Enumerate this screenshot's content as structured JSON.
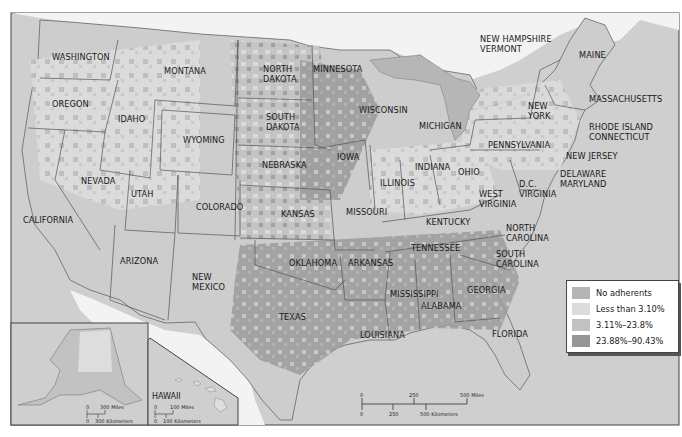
{
  "map": {
    "title": "",
    "subject": "Adherence rates by county, contiguous United States with Alaska and Hawaii insets",
    "colors": {
      "background_water": "#cfcfcf",
      "land_outside": "#f2f2f2",
      "no_adherents": "#b4b4b4",
      "less_than_3_10": "#dcdcdc",
      "3_11_to_23_8": "#bcbcbc",
      "23_88_to_90_43": "#969696",
      "border": "#555555"
    },
    "legend": {
      "items": [
        {
          "label": "No adherents",
          "color": "#b4b4b4"
        },
        {
          "label": "Less than 3.10%",
          "color": "#dcdcdc"
        },
        {
          "label": "3.11%–23.8%",
          "color": "#c2c2c2"
        },
        {
          "label": "23.88%–90.43%",
          "color": "#969696"
        }
      ]
    },
    "state_labels": [
      {
        "name": "WASHINGTON",
        "x": 52,
        "y": 60
      },
      {
        "name": "OREGON",
        "x": 52,
        "y": 107
      },
      {
        "name": "IDAHO",
        "x": 118,
        "y": 122
      },
      {
        "name": "MONTANA",
        "x": 164,
        "y": 74
      },
      {
        "name": "WYOMING",
        "x": 183,
        "y": 143
      },
      {
        "name": "NEVADA",
        "x": 81,
        "y": 184
      },
      {
        "name": "UTAH",
        "x": 131,
        "y": 197
      },
      {
        "name": "COLORADO",
        "x": 196,
        "y": 210
      },
      {
        "name": "CALIFORNIA",
        "x": 23,
        "y": 223
      },
      {
        "name": "ARIZONA",
        "x": 120,
        "y": 264
      },
      {
        "name": "NEW|MEXICO",
        "x": 192,
        "y": 280
      },
      {
        "name": "NORTH|DAKOTA",
        "x": 263,
        "y": 72
      },
      {
        "name": "MINNESOTA",
        "x": 313,
        "y": 72
      },
      {
        "name": "SOUTH|DAKOTA",
        "x": 266,
        "y": 120
      },
      {
        "name": "NEBRASKA",
        "x": 262,
        "y": 168
      },
      {
        "name": "IOWA",
        "x": 337,
        "y": 160
      },
      {
        "name": "KANSAS",
        "x": 281,
        "y": 217
      },
      {
        "name": "OKLAHOMA",
        "x": 289,
        "y": 266
      },
      {
        "name": "TEXAS",
        "x": 279,
        "y": 320
      },
      {
        "name": "WISCONSIN",
        "x": 359,
        "y": 113
      },
      {
        "name": "MICHIGAN",
        "x": 419,
        "y": 129
      },
      {
        "name": "ILLINOIS",
        "x": 380,
        "y": 186
      },
      {
        "name": "INDIANA",
        "x": 415,
        "y": 170
      },
      {
        "name": "OHIO",
        "x": 458,
        "y": 175
      },
      {
        "name": "MISSOURI",
        "x": 346,
        "y": 215
      },
      {
        "name": "ARKANSAS",
        "x": 348,
        "y": 266
      },
      {
        "name": "LOUISIANA",
        "x": 360,
        "y": 338
      },
      {
        "name": "MISSISSIPPI",
        "x": 390,
        "y": 297
      },
      {
        "name": "ALABAMA",
        "x": 421,
        "y": 309
      },
      {
        "name": "TENNESSEE",
        "x": 411,
        "y": 251
      },
      {
        "name": "KENTUCKY",
        "x": 426,
        "y": 225
      },
      {
        "name": "GEORGIA",
        "x": 467,
        "y": 293
      },
      {
        "name": "FLORIDA",
        "x": 492,
        "y": 337
      },
      {
        "name": "SOUTH|CAROLINA",
        "x": 496,
        "y": 257
      },
      {
        "name": "NORTH|CAROLINA",
        "x": 506,
        "y": 231
      },
      {
        "name": "WEST|VIRGINIA",
        "x": 479,
        "y": 197
      },
      {
        "name": "D.C.|VIRGINIA",
        "x": 519,
        "y": 187
      },
      {
        "name": "PENNSYLVANIA",
        "x": 488,
        "y": 148
      },
      {
        "name": "NEW|YORK",
        "x": 528,
        "y": 109
      },
      {
        "name": "NEW JERSEY",
        "x": 566,
        "y": 159
      },
      {
        "name": "DELAWARE|MARYLAND",
        "x": 560,
        "y": 177
      },
      {
        "name": "NEW HAMPSHIRE|VERMONT",
        "x": 480,
        "y": 42
      },
      {
        "name": "MAINE",
        "x": 579,
        "y": 58
      },
      {
        "name": "MASSACHUSETTS",
        "x": 589,
        "y": 102
      },
      {
        "name": "RHODE ISLAND|CONNECTICUT",
        "x": 589,
        "y": 130
      }
    ],
    "insets": {
      "alaska": {
        "scale_miles": {
          "zero": "0",
          "max": "300 Miles"
        },
        "scale_km": {
          "zero": "0",
          "max": "300 Kilometers"
        }
      },
      "hawaii": {
        "label": "HAWAII",
        "scale_miles": {
          "zero": "0",
          "max": "100 Miles"
        },
        "scale_km": {
          "zero": "0",
          "max": "100 Kilometers"
        }
      }
    },
    "scale_bar": {
      "miles": [
        "0",
        "250",
        "500 Miles"
      ],
      "km": [
        "0",
        "250",
        "500 Kilometers"
      ]
    }
  }
}
